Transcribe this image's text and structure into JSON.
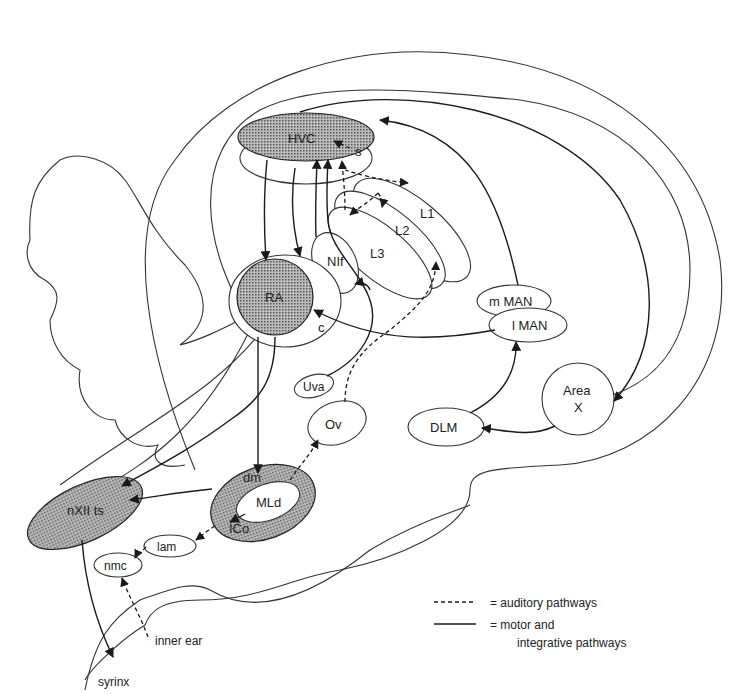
{
  "diagram": {
    "type": "songbird brain song system (sagittal schematic)",
    "nuclei": {
      "hvc": "HVC",
      "s": "s",
      "ra": "RA",
      "c": "c",
      "nif": "NIf",
      "l1": "L1",
      "l2": "L2",
      "l3": "L3",
      "mman": "m MAN",
      "lman": "l MAN",
      "area_x_line1": "Area",
      "area_x_line2": "X",
      "dlm": "DLM",
      "uva": "Uva",
      "ov": "Ov",
      "dm": "dm",
      "mld": "MLd",
      "ico": "ICo",
      "nxii": "nXII ts",
      "lam": "lam",
      "nmc": "nmc"
    },
    "external": {
      "inner_ear": "inner ear",
      "syrinx": "syrinx"
    },
    "shaded_nuclei": [
      "HVC",
      "RA",
      "dm/ICo ring",
      "nXII ts"
    ],
    "legend": {
      "dashed_label": "= auditory pathways",
      "solid_label_line1": "= motor and",
      "solid_label_line2": "integrative pathways"
    },
    "colors": {
      "line": "#1a1a1a",
      "shading": "#9a9a9a",
      "background": "#ffffff"
    }
  }
}
